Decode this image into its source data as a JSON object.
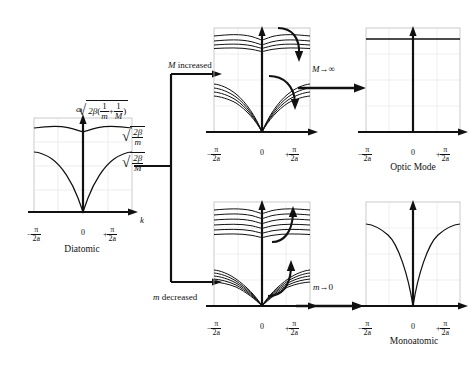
{
  "figure": {
    "type": "diagram",
    "panels": [
      {
        "id": "diatomic",
        "caption": "Diatomic",
        "y_axis_label": "ω",
        "x_axis_label": "k",
        "x_ticks": [
          "-π/2a",
          "0",
          "+π/2a"
        ],
        "branches": [
          "optic",
          "acoustic"
        ],
        "annotations": [
          {
            "id": "top-value",
            "text": "sqrt(2β(1/m + 1/M))",
            "beta": "2β",
            "inner_left": "1/m",
            "inner_right": "1/M"
          },
          {
            "id": "optic-edge",
            "text": "sqrt(2β/m)",
            "num": "2β",
            "den": "m"
          },
          {
            "id": "acoustic-edge",
            "text": "sqrt(2β/M)",
            "num": "2β",
            "den": "M"
          }
        ]
      },
      {
        "id": "m-increased",
        "caption": "",
        "x_ticks": [
          "-π/2a",
          "0",
          "+π/2a"
        ],
        "branches": [
          "optic-family",
          "acoustic-family"
        ],
        "curve_count": 4,
        "arrow_direction": "down"
      },
      {
        "id": "optic-mode",
        "caption": "Optic Mode",
        "x_ticks": [
          "-π/2a",
          "0",
          "+π/2a"
        ],
        "branches": [
          "flat-optic"
        ],
        "curve_count": 1
      },
      {
        "id": "m-decreased",
        "caption": "",
        "x_ticks": [
          "-π/2a",
          "0",
          "+π/2a"
        ],
        "branches": [
          "optic-family",
          "acoustic-family"
        ],
        "curve_count": 6,
        "arrow_direction": "up"
      },
      {
        "id": "monoatomic",
        "caption": "Monoatomic",
        "x_ticks": [
          "-π/2a",
          "0",
          "+π/2a"
        ],
        "branches": [
          "acoustic"
        ],
        "curve_count": 1
      }
    ],
    "transitions": [
      {
        "id": "m-increased-arrow",
        "label": "M increased",
        "symbol": "M",
        "rest": " increased"
      },
      {
        "id": "m-to-infinity-arrow",
        "label": "M→∞",
        "symbol": "M",
        "rest": "→∞"
      },
      {
        "id": "m-decreased-arrow",
        "label": "m decreased",
        "symbol": "m",
        "rest": " decreased"
      },
      {
        "id": "m-to-zero-arrow",
        "label": "m→0",
        "symbol": "m",
        "rest": "→0"
      }
    ],
    "tick_parts": {
      "pi": "π",
      "two_a": "2a",
      "zero": "0",
      "minus": "−",
      "plus": "+"
    },
    "colors": {
      "ink": "#111111",
      "grid": "#b9b9b9",
      "background": "#ffffff"
    }
  }
}
